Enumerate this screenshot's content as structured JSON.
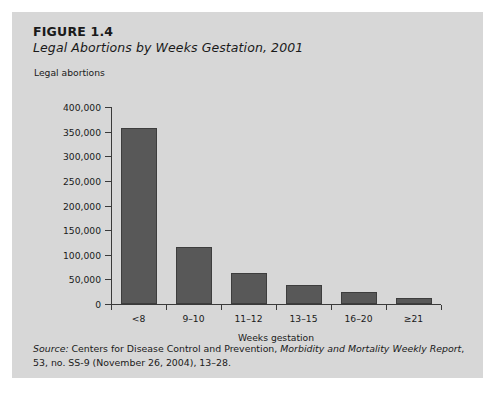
{
  "figure": {
    "number": "FIGURE 1.4",
    "title": "Legal Abortions by Weeks Gestation, 2001"
  },
  "source": {
    "label": "Source:",
    "text_before_pub": " Centers for Disease Control and Prevention, ",
    "publication": "Morbidity and Mortality Weekly Report",
    "text_after_pub": ", 53, no. SS-9 (November 26, 2004), 13–28."
  },
  "colors": {
    "panel_background": "#d7d7d7",
    "bar_fill": "#585858",
    "bar_border": "#3d3d3d",
    "axis": "#3a3a3a",
    "text": "#1a1a1a"
  },
  "chart_data": {
    "type": "bar",
    "title": "Legal Abortions by Weeks Gestation, 2001",
    "xlabel": "Weeks gestation",
    "ylabel": "Legal abortions",
    "categories": [
      "<8",
      "9–10",
      "11–12",
      "13–15",
      "16–20",
      "≥21"
    ],
    "values": [
      358000,
      115000,
      62000,
      38000,
      24000,
      12000
    ],
    "ylim": [
      0,
      400000
    ],
    "ytick_values": [
      0,
      50000,
      100000,
      150000,
      200000,
      250000,
      300000,
      350000,
      400000
    ],
    "ytick_labels": [
      "0",
      "50,000",
      "100,000",
      "150,000",
      "200,000",
      "250,000",
      "300,000",
      "350,000",
      "400,000"
    ],
    "grid": false,
    "legend": false,
    "series": [
      {
        "name": "Legal abortions",
        "values": [
          358000,
          115000,
          62000,
          38000,
          24000,
          12000
        ]
      }
    ]
  }
}
